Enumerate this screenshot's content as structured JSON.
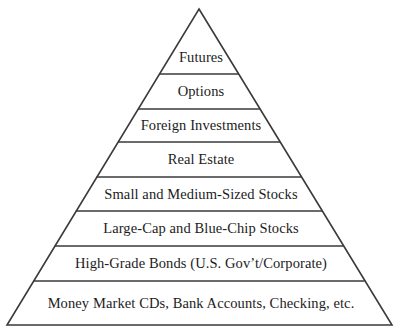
{
  "figure": {
    "name": "investment-risk-pyramid",
    "type": "pyramid-diagram",
    "background_color": "#ffffff",
    "stroke_color": "#3a3a3a",
    "text_color": "#1c1c1c"
  },
  "chart_data": {
    "type": "pyramid",
    "title": "",
    "subtitle": "",
    "xlabel": "",
    "ylabel": "",
    "grid": false,
    "legend": "none",
    "apex": {
      "x": 199,
      "y": 9
    },
    "base_left": {
      "x": 7,
      "y": 325
    },
    "base_right": {
      "x": 392,
      "y": 325
    },
    "divider_y": [
      74,
      109,
      142,
      177,
      211,
      246,
      281
    ],
    "categories": [
      "Futures",
      "Options",
      "Foreign Investments",
      "Real Estate",
      "Small and Medium-Sized Stocks",
      "Large-Cap and Blue-Chip Stocks",
      "High-Grade Bonds (U.S. Gov’t/Corporate)",
      "Money Market CDs, Bank Accounts, Checking, etc."
    ],
    "values": [
      1,
      2,
      3,
      4,
      5,
      6,
      7,
      8
    ],
    "tier_order": "top-to-bottom"
  },
  "tiers": [
    {
      "label": "Futures",
      "index": 1,
      "top_y": 9,
      "bottom_y": 74,
      "text_center_y": 58,
      "font_size": 14.5
    },
    {
      "label": "Options",
      "index": 2,
      "top_y": 74,
      "bottom_y": 109,
      "text_center_y": 92,
      "font_size": 14.5
    },
    {
      "label": "Foreign Investments",
      "index": 3,
      "top_y": 109,
      "bottom_y": 142,
      "text_center_y": 126,
      "font_size": 14.5
    },
    {
      "label": "Real Estate",
      "index": 4,
      "top_y": 142,
      "bottom_y": 177,
      "text_center_y": 160,
      "font_size": 14.5
    },
    {
      "label": "Small and Medium-Sized Stocks",
      "index": 5,
      "top_y": 177,
      "bottom_y": 211,
      "text_center_y": 195,
      "font_size": 14.5
    },
    {
      "label": "Large-Cap and Blue-Chip Stocks",
      "index": 6,
      "top_y": 211,
      "bottom_y": 246,
      "text_center_y": 229,
      "font_size": 14.5
    },
    {
      "label": "High-Grade Bonds (U.S. Gov’t/Corporate)",
      "index": 7,
      "top_y": 246,
      "bottom_y": 281,
      "text_center_y": 264,
      "font_size": 14.5
    },
    {
      "label": "Money Market CDs, Bank Accounts, Checking, etc.",
      "index": 8,
      "top_y": 281,
      "bottom_y": 325,
      "text_center_y": 304,
      "font_size": 14.5
    }
  ]
}
